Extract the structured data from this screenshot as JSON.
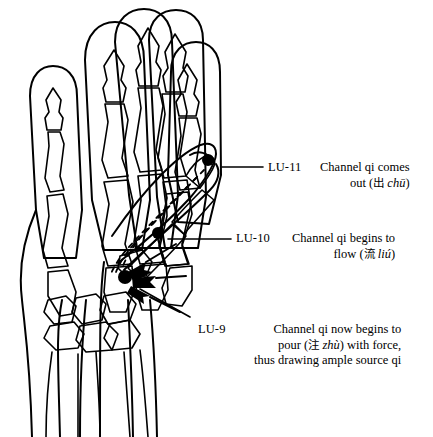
{
  "figure": {
    "background_color": "#ffffff",
    "ink_color": "#000000",
    "width": 433,
    "height": 437
  },
  "illustration": {
    "name": "hand-skeleton-line-drawing",
    "description": "Line drawing of a right hand, palmar view, showing skeletal bones of the fingers, metacarpals, carpals and distal forearm, with the thumb extended to the right",
    "marker_color": "#000000",
    "flow_arrow_style": "dashed-with-solid-arrowheads"
  },
  "points": [
    {
      "code": "LU-11",
      "description_lines": [
        {
          "text": "Channel qi comes"
        },
        {
          "text": "out (",
          "cjk": "出",
          "pinyin": "chū",
          "tail": ")"
        }
      ],
      "marker": {
        "x": 208,
        "y": 160
      },
      "leader": {
        "x1": 220,
        "y1": 167,
        "x2": 262,
        "y2": 167
      }
    },
    {
      "code": "LU-10",
      "description_lines": [
        {
          "text": "Channel qi begins to"
        },
        {
          "text": "flow (",
          "cjk": "流",
          "pinyin": "liú",
          "tail": ")"
        }
      ],
      "marker": {
        "x": 158,
        "y": 233
      },
      "leader": {
        "x1": 168,
        "y1": 239,
        "x2": 230,
        "y2": 239
      }
    },
    {
      "code": "LU-9",
      "description_lines": [
        {
          "text": "Channel qi now begins to"
        },
        {
          "text": "pour (",
          "cjk": "注",
          "pinyin": "zhù",
          "tail": ") with force,"
        },
        {
          "text": "thus drawing ample source qi"
        }
      ],
      "marker": {
        "x": 125,
        "y": 277
      },
      "leader": {
        "x1": 137,
        "y1": 288,
        "x2": 188,
        "y2": 316
      }
    }
  ]
}
